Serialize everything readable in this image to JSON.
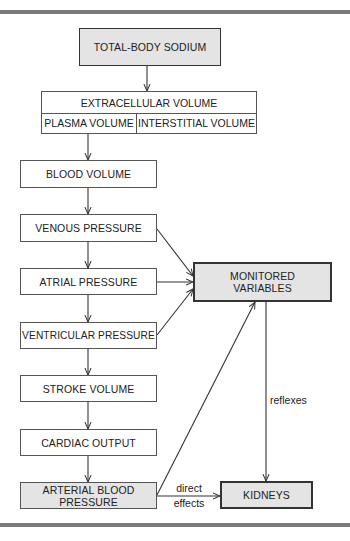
{
  "diagram": {
    "nodes": {
      "total_body_sodium": "TOTAL-BODY SODIUM",
      "extracellular_volume": "EXTRACELLULAR VOLUME",
      "plasma_volume": "PLASMA VOLUME",
      "interstitial_volume": "INTERSTITIAL VOLUME",
      "blood_volume": "BLOOD VOLUME",
      "venous_pressure": "VENOUS PRESSURE",
      "atrial_pressure": "ATRIAL PRESSURE",
      "ventricular_pressure": "VENTRICULAR PRESSURE",
      "stroke_volume": "STROKE VOLUME",
      "cardiac_output": "CARDIAC OUTPUT",
      "arterial_blood_pressure_line1": "ARTERIAL BLOOD",
      "arterial_blood_pressure_line2": "PRESSURE",
      "monitored_variables_line1": "MONITORED",
      "monitored_variables_line2": "VARIABLES",
      "kidneys": "KIDNEYS"
    },
    "edge_labels": {
      "reflexes": "reflexes",
      "direct": "direct",
      "effects": "effects"
    },
    "edges": [
      {
        "from": "TOTAL-BODY SODIUM",
        "to": "EXTRACELLULAR VOLUME"
      },
      {
        "from": "PLASMA VOLUME",
        "to": "BLOOD VOLUME"
      },
      {
        "from": "BLOOD VOLUME",
        "to": "VENOUS PRESSURE"
      },
      {
        "from": "VENOUS PRESSURE",
        "to": "ATRIAL PRESSURE"
      },
      {
        "from": "ATRIAL PRESSURE",
        "to": "VENTRICULAR PRESSURE"
      },
      {
        "from": "VENTRICULAR PRESSURE",
        "to": "STROKE VOLUME"
      },
      {
        "from": "STROKE VOLUME",
        "to": "CARDIAC OUTPUT"
      },
      {
        "from": "CARDIAC OUTPUT",
        "to": "ARTERIAL BLOOD PRESSURE"
      },
      {
        "from": "VENOUS PRESSURE",
        "to": "MONITORED VARIABLES"
      },
      {
        "from": "ATRIAL PRESSURE",
        "to": "MONITORED VARIABLES"
      },
      {
        "from": "VENTRICULAR PRESSURE",
        "to": "MONITORED VARIABLES"
      },
      {
        "from": "ARTERIAL BLOOD PRESSURE",
        "to": "MONITORED VARIABLES"
      },
      {
        "from": "MONITORED VARIABLES",
        "to": "KIDNEYS",
        "label": "reflexes"
      },
      {
        "from": "ARTERIAL BLOOD PRESSURE",
        "to": "KIDNEYS",
        "label": "direct effects"
      }
    ],
    "colors": {
      "shaded_fill": "#e4e4e4",
      "border": "#333333",
      "rule": "#7a7a7a"
    }
  }
}
